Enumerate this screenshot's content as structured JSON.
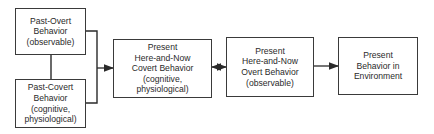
{
  "diagram": {
    "nodes": [
      {
        "id": "past-overt",
        "lines": [
          "Past-Overt",
          "Behavior",
          "(observable)"
        ]
      },
      {
        "id": "past-covert",
        "lines": [
          "Past-Covert",
          "Behavior",
          "(cognitive,",
          "physiological)"
        ]
      },
      {
        "id": "present-covert",
        "lines": [
          "Present",
          "Here-and-Now",
          "Covert Behavior",
          "(cognitive,",
          "physiological)"
        ]
      },
      {
        "id": "present-overt",
        "lines": [
          "Present",
          "Here-and-Now",
          "Overt Behavior",
          "(observable)"
        ]
      },
      {
        "id": "present-environment",
        "lines": [
          "Present",
          "Behavior in",
          "Environment"
        ]
      }
    ],
    "edges": [
      {
        "from": "past-overt",
        "to": "past-covert",
        "type": "line"
      },
      {
        "from": [
          "past-overt",
          "past-covert"
        ],
        "to": "present-covert",
        "type": "arrow"
      },
      {
        "from": "present-covert",
        "to": "present-overt",
        "type": "bidirectional-arrow"
      },
      {
        "from": "present-overt",
        "to": "present-environment",
        "type": "arrow"
      }
    ],
    "line_color": "#2a2a2a"
  }
}
